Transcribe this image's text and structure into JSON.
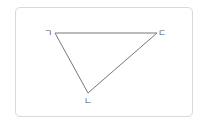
{
  "diagram": {
    "type": "triangle",
    "vertices": [
      {
        "label": "ㄱ",
        "x": 55,
        "y": 33
      },
      {
        "label": "ㄷ",
        "x": 157,
        "y": 33
      },
      {
        "label": "ㄴ",
        "x": 88,
        "y": 93
      }
    ],
    "edges": [
      [
        "ㄱ",
        "ㄷ"
      ],
      [
        "ㄷ",
        "ㄴ"
      ],
      [
        "ㄴ",
        "ㄱ"
      ]
    ],
    "colors": {
      "line": "#777777",
      "border": "#d9d9d9",
      "label": "#555555"
    }
  }
}
